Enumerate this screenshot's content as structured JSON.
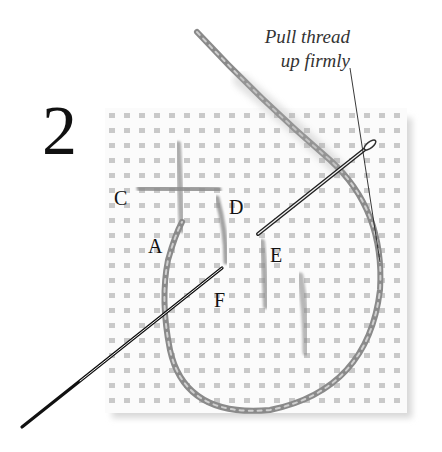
{
  "diagram": {
    "step_number": "2",
    "callout": {
      "line1": "Pull thread",
      "line2": "up firmly"
    },
    "points": [
      {
        "id": "C",
        "label": "C",
        "x": 114,
        "y": 188
      },
      {
        "id": "D",
        "label": "D",
        "x": 229,
        "y": 197
      },
      {
        "id": "A",
        "label": "A",
        "x": 148,
        "y": 236
      },
      {
        "id": "E",
        "label": "E",
        "x": 270,
        "y": 245
      },
      {
        "id": "F",
        "label": "F",
        "x": 214,
        "y": 290
      }
    ],
    "elements": {
      "canvas": "needlepoint canvas mesh grid",
      "needle": "needle-icon",
      "thread": "yarn thread loop"
    },
    "colors": {
      "ink": "#111111",
      "thread": "#8a8a8a",
      "mesh": "#bdbdbd",
      "background": "#ffffff"
    }
  }
}
